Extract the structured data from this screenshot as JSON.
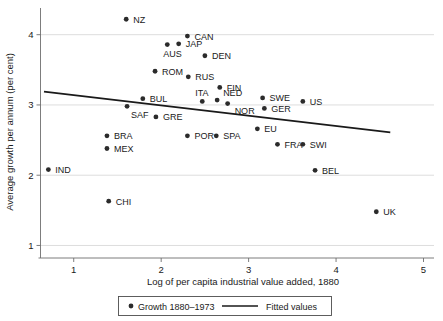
{
  "chart_data": {
    "type": "scatter",
    "title": "",
    "xlabel": "Log of per capita industrial value added, 1880",
    "ylabel": "Average growth per annum (per cent)",
    "xlim": [
      0.62,
      5.12
    ],
    "ylim": [
      0.85,
      4.38
    ],
    "xticks": [
      1,
      2,
      3,
      4,
      5
    ],
    "yticks": [
      1,
      2,
      3,
      4
    ],
    "xtick_labels": [
      "1",
      "2",
      "3",
      "4",
      "5"
    ],
    "ytick_labels": [
      "1",
      "2",
      "3",
      "4"
    ],
    "grid": "horizontal",
    "legend_position": "below-axis",
    "legend": [
      {
        "label": "Growth 1880–1973",
        "marker": "dot",
        "color": "#2b2b2b"
      },
      {
        "label": "Fitted values",
        "marker": "line",
        "color": "#1a1a1a"
      }
    ],
    "series": [
      {
        "name": "Growth 1880–1973",
        "marker": "dot",
        "color": "#2b2b2b",
        "points": [
          {
            "label": "NZ",
            "x": 1.6,
            "y": 4.22,
            "lx": 7,
            "ly": 3.5
          },
          {
            "label": "CAN",
            "x": 2.3,
            "y": 3.98,
            "lx": 7,
            "ly": 3.5
          },
          {
            "label": "JAP",
            "x": 2.2,
            "y": 3.87,
            "lx": 7,
            "ly": 3.5
          },
          {
            "label": "AUS",
            "x": 2.07,
            "y": 3.86,
            "lx": -4,
            "ly": 12.5
          },
          {
            "label": "DEN",
            "x": 2.5,
            "y": 3.7,
            "lx": 7,
            "ly": 3.5
          },
          {
            "label": "ROM",
            "x": 1.93,
            "y": 3.48,
            "lx": 7,
            "ly": 3.5
          },
          {
            "label": "RUS",
            "x": 2.31,
            "y": 3.4,
            "lx": 7,
            "ly": 3.5
          },
          {
            "label": "FIN",
            "x": 2.67,
            "y": 3.25,
            "lx": 7,
            "ly": 3.5
          },
          {
            "label": "ITA",
            "x": 2.47,
            "y": 3.05,
            "lx": -7,
            "ly": -5.5
          },
          {
            "label": "NED",
            "x": 2.64,
            "y": 3.07,
            "lx": 6,
            "ly": -4.0
          },
          {
            "label": "NOR",
            "x": 2.76,
            "y": 3.02,
            "lx": 7,
            "ly": 10.0
          },
          {
            "label": "BUL",
            "x": 1.79,
            "y": 3.09,
            "lx": 7,
            "ly": 3.5
          },
          {
            "label": "SAF",
            "x": 1.61,
            "y": 2.98,
            "lx": 4,
            "ly": 12.0
          },
          {
            "label": "GRE",
            "x": 1.94,
            "y": 2.83,
            "lx": 7,
            "ly": 3.5
          },
          {
            "label": "SWE",
            "x": 3.16,
            "y": 3.1,
            "lx": 7,
            "ly": 3.5
          },
          {
            "label": "GER",
            "x": 3.18,
            "y": 2.95,
            "lx": 7,
            "ly": 3.5
          },
          {
            "label": "US",
            "x": 3.62,
            "y": 3.05,
            "lx": 7,
            "ly": 3.5
          },
          {
            "label": "EU",
            "x": 3.1,
            "y": 2.66,
            "lx": 7,
            "ly": 3.5
          },
          {
            "label": "BRA",
            "x": 1.38,
            "y": 2.56,
            "lx": 7,
            "ly": 3.5
          },
          {
            "label": "MEX",
            "x": 1.38,
            "y": 2.38,
            "lx": 7,
            "ly": 3.5
          },
          {
            "label": "POR",
            "x": 2.3,
            "y": 2.56,
            "lx": 7,
            "ly": 3.5
          },
          {
            "label": "SPA",
            "x": 2.63,
            "y": 2.56,
            "lx": 7,
            "ly": 3.5
          },
          {
            "label": "FRA",
            "x": 3.33,
            "y": 2.44,
            "lx": 7,
            "ly": 3.5
          },
          {
            "label": "SWI",
            "x": 3.62,
            "y": 2.44,
            "lx": 7,
            "ly": 3.5
          },
          {
            "label": "IND",
            "x": 0.71,
            "y": 2.08,
            "lx": 7,
            "ly": 3.5
          },
          {
            "label": "BEL",
            "x": 3.76,
            "y": 2.07,
            "lx": 7,
            "ly": 3.5
          },
          {
            "label": "CHI",
            "x": 1.4,
            "y": 1.63,
            "lx": 7,
            "ly": 3.5
          },
          {
            "label": "UK",
            "x": 4.46,
            "y": 1.48,
            "lx": 7,
            "ly": 3.5
          }
        ]
      }
    ],
    "fitted_line": {
      "name": "Fitted values",
      "color": "#1a1a1a",
      "x0": 0.66,
      "y0": 3.19,
      "x1": 4.62,
      "y1": 2.61
    }
  }
}
